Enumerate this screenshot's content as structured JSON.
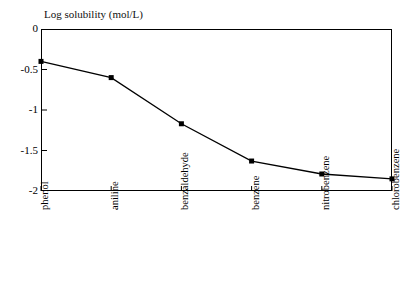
{
  "chart_data": {
    "type": "line",
    "title": "Log solubility (mol/L)",
    "xlabel": "",
    "ylabel": "Log solubility (mol/L)",
    "categories": [
      "phenol",
      "aniline",
      "benzaldehyde",
      "benzene",
      "nitrobenzene",
      "chlorobenzene"
    ],
    "values": [
      -0.4,
      -0.6,
      -1.17,
      -1.63,
      -1.79,
      -1.85
    ],
    "series": [
      {
        "name": "Log solubility (mol/L)",
        "values": [
          -0.4,
          -0.6,
          -1.17,
          -1.63,
          -1.79,
          -1.85
        ]
      }
    ],
    "ylim": [
      -2,
      0
    ],
    "yticks": [
      0,
      -0.5,
      -1,
      -1.5,
      -2
    ],
    "ytick_labels": [
      "0",
      "-0.5",
      "-1",
      "-1.5",
      "-2"
    ],
    "grid": false,
    "legend": "none",
    "marker": "filled-square",
    "line_color": "#000000",
    "marker_color": "#000000",
    "frame_color": "#000000",
    "background_color": "#ffffff"
  },
  "axes": {
    "y_labels": [
      {
        "text": "0",
        "value": 0
      },
      {
        "text": "-0.5",
        "value": -0.5
      },
      {
        "text": "-1",
        "value": -1
      },
      {
        "text": "-1.5",
        "value": -1.5
      },
      {
        "text": "-2",
        "value": -2
      }
    ],
    "x_labels": [
      {
        "text": "phenol"
      },
      {
        "text": "aniline"
      },
      {
        "text": "benzaldehyde"
      },
      {
        "text": "benzene"
      },
      {
        "text": "nitrobenzene"
      },
      {
        "text": "chlorobenzene"
      }
    ]
  }
}
